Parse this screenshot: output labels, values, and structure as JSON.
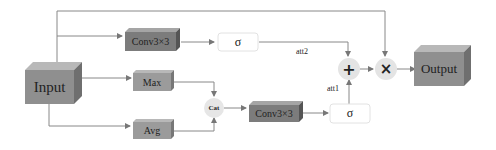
{
  "diagram": {
    "nodes": {
      "input": {
        "label": "Input"
      },
      "conv_top": {
        "label": "Conv3×3"
      },
      "sigma_top": {
        "label": "σ"
      },
      "max": {
        "label": "Max"
      },
      "avg": {
        "label": "Avg"
      },
      "cat": {
        "label": "Cat"
      },
      "conv_bottom": {
        "label": "Conv3×3"
      },
      "sigma_bottom": {
        "label": "σ"
      },
      "add": {
        "label": "+"
      },
      "mul": {
        "label": "×"
      },
      "output": {
        "label": "Output"
      }
    },
    "edge_labels": {
      "att2": "att2",
      "att1": "att1"
    },
    "colors": {
      "box_front": "#8f8f8f",
      "box_top": "#b5b5b5",
      "box_side": "#6e6e6e",
      "small_box_front": "#999999",
      "conv_front": "#7a7a7a",
      "sigma_fill": "#ffffff",
      "sigma_border": "#e2e2e2",
      "circle_fill": "#e4e4e4",
      "line": "#777777"
    }
  }
}
